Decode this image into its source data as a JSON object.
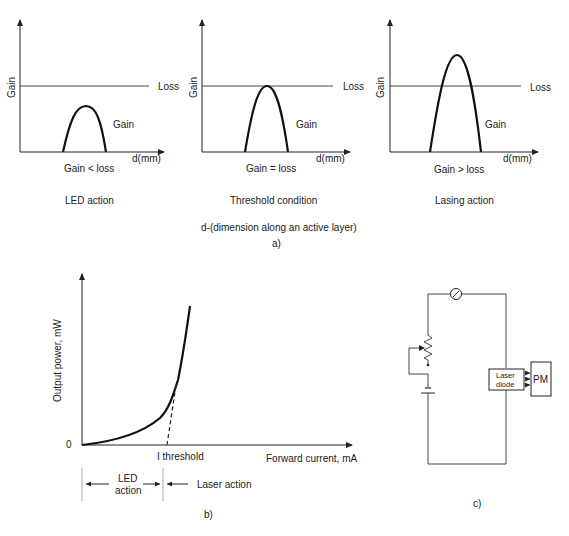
{
  "panel_a": {
    "caption": "a)",
    "subtitle": "d-(dimension along an active layer)",
    "plots": [
      {
        "y_label": "Gain",
        "x_label": "d(mm)",
        "loss_label": "Loss",
        "gain_label": "Gain",
        "condition": "Gain < loss",
        "title": "LED action"
      },
      {
        "y_label": "Gain",
        "x_label": "d(mm)",
        "loss_label": "Loss",
        "gain_label": "Gain",
        "condition": "Gain = loss",
        "title": "Threshold condition"
      },
      {
        "y_label": "Gain",
        "x_label": "d(mm)",
        "loss_label": "Loss",
        "gain_label": "Gain",
        "condition": "Gain > loss",
        "title": "Lasing action"
      }
    ]
  },
  "panel_b": {
    "caption": "b)",
    "y_label": "Output power, mW",
    "x_label": "Forward current, mA",
    "origin_label": "0",
    "threshold_label": "I threshold",
    "led_region_label_line1": "LED",
    "led_region_label_line2": "action",
    "laser_region_label": "Laser action"
  },
  "panel_c": {
    "caption": "c)",
    "laser_diode_line1": "Laser",
    "laser_diode_line2": "diode",
    "power_meter_label": "PM"
  }
}
